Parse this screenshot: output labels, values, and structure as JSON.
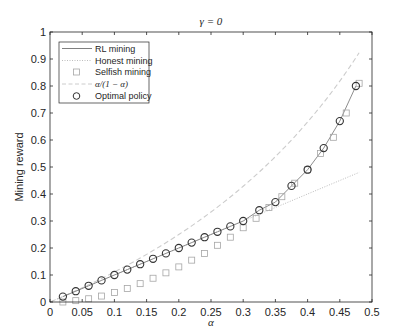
{
  "chart_data": {
    "type": "line",
    "title": "γ = 0",
    "xlabel": "α",
    "ylabel": "Mining reward",
    "xlim": [
      0,
      0.5
    ],
    "ylim": [
      0,
      1
    ],
    "xticks": [
      0,
      0.05,
      0.1,
      0.15,
      0.2,
      0.25,
      0.3,
      0.35,
      0.4,
      0.45,
      0.5
    ],
    "xtick_labels": [
      "0",
      "0.05",
      "0.1",
      "0.15",
      "0.2",
      "0.25",
      "0.3",
      "0.35",
      "0.4",
      "0.45",
      "0.5"
    ],
    "yticks": [
      0,
      0.1,
      0.2,
      0.3,
      0.4,
      0.5,
      0.6,
      0.7,
      0.8,
      0.9,
      1
    ],
    "ytick_labels": [
      "0",
      "0.1",
      "0.2",
      "0.3",
      "0.4",
      "0.5",
      "0.6",
      "0.7",
      "0.8",
      "0.9",
      "1"
    ],
    "grid": false,
    "legend_position": "upper left",
    "series": [
      {
        "name": "RL mining",
        "style": "solid line",
        "color": "#808080",
        "x": [
          0.02,
          0.04,
          0.06,
          0.08,
          0.1,
          0.12,
          0.14,
          0.16,
          0.18,
          0.2,
          0.22,
          0.24,
          0.26,
          0.28,
          0.3,
          0.325,
          0.35,
          0.375,
          0.4,
          0.425,
          0.45,
          0.475
        ],
        "y": [
          0.02,
          0.04,
          0.06,
          0.08,
          0.1,
          0.12,
          0.14,
          0.16,
          0.18,
          0.2,
          0.22,
          0.24,
          0.26,
          0.28,
          0.3,
          0.34,
          0.37,
          0.43,
          0.49,
          0.57,
          0.67,
          0.8
        ]
      },
      {
        "name": "Honest mining",
        "style": "dotted line",
        "color": "#bdbdbd",
        "x": [
          0,
          0.48
        ],
        "y": [
          0,
          0.48
        ]
      },
      {
        "name": "Selfish mining",
        "style": "square markers",
        "color": "#a6a6a6",
        "x": [
          0.02,
          0.04,
          0.06,
          0.08,
          0.1,
          0.12,
          0.14,
          0.16,
          0.18,
          0.2,
          0.22,
          0.24,
          0.26,
          0.28,
          0.3,
          0.32,
          0.34,
          0.36,
          0.38,
          0.4,
          0.42,
          0.44,
          0.46,
          0.48
        ],
        "y": [
          0.0,
          0.005,
          0.012,
          0.022,
          0.035,
          0.05,
          0.068,
          0.088,
          0.108,
          0.13,
          0.155,
          0.18,
          0.21,
          0.24,
          0.275,
          0.31,
          0.35,
          0.39,
          0.44,
          0.49,
          0.55,
          0.61,
          0.7,
          0.81
        ]
      },
      {
        "name": "α/(1 − α)",
        "style": "dashed line",
        "color": "#cccccc",
        "x": [
          0.0,
          0.05,
          0.1,
          0.15,
          0.2,
          0.25,
          0.3,
          0.35,
          0.4,
          0.45,
          0.48
        ],
        "y": [
          0.0,
          0.0526,
          0.1111,
          0.1765,
          0.25,
          0.3333,
          0.4286,
          0.5385,
          0.6667,
          0.8182,
          0.9231
        ]
      },
      {
        "name": "Optimal policy",
        "style": "circle markers",
        "color": "#333333",
        "x": [
          0.02,
          0.04,
          0.06,
          0.08,
          0.1,
          0.12,
          0.14,
          0.16,
          0.18,
          0.2,
          0.22,
          0.24,
          0.26,
          0.28,
          0.3,
          0.325,
          0.35,
          0.375,
          0.4,
          0.425,
          0.45,
          0.475
        ],
        "y": [
          0.02,
          0.04,
          0.06,
          0.08,
          0.1,
          0.12,
          0.14,
          0.16,
          0.18,
          0.2,
          0.22,
          0.24,
          0.26,
          0.28,
          0.3,
          0.34,
          0.37,
          0.43,
          0.49,
          0.57,
          0.67,
          0.8
        ]
      }
    ]
  },
  "legend": {
    "items": [
      {
        "label": "RL mining"
      },
      {
        "label": "Honest mining"
      },
      {
        "label": "Selfish mining"
      },
      {
        "label": "α/(1 − α)"
      },
      {
        "label": "Optimal policy"
      }
    ]
  },
  "colors": {
    "axis": "#262626",
    "rl_line": "#808080",
    "honest": "#bdbdbd",
    "selfish": "#a6a6a6",
    "ratio": "#cccccc",
    "optimal": "#333333"
  }
}
